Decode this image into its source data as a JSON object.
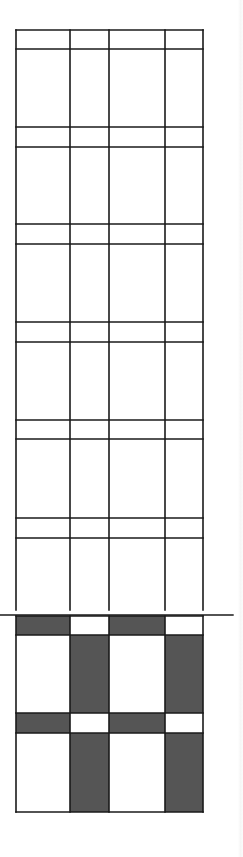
{
  "figure": {
    "colors": {
      "line": "#1a1a1a",
      "shade": "#555555",
      "background": "#ffffff"
    },
    "columns_x": [
      16,
      70,
      109,
      165,
      203
    ],
    "upper_grid": {
      "top": 30,
      "bottom": 610,
      "row_lines_y": [
        30,
        49,
        127,
        147,
        224,
        244,
        322,
        342,
        420,
        439,
        518,
        538
      ],
      "open_bottom": true
    },
    "divider": {
      "y": 615,
      "x1": 0,
      "x2": 233
    },
    "lower_grid": {
      "rows": [
        {
          "top": 616,
          "bottom": 635,
          "kind": "band",
          "shaded_cols": [
            0,
            2
          ]
        },
        {
          "top": 635,
          "bottom": 713,
          "kind": "tall",
          "shaded_cols": [
            1,
            3
          ]
        },
        {
          "top": 713,
          "bottom": 733,
          "kind": "band",
          "shaded_cols": [
            0,
            2
          ]
        },
        {
          "top": 733,
          "bottom": 812,
          "kind": "tall",
          "shaded_cols": [
            1,
            3
          ]
        }
      ]
    }
  }
}
